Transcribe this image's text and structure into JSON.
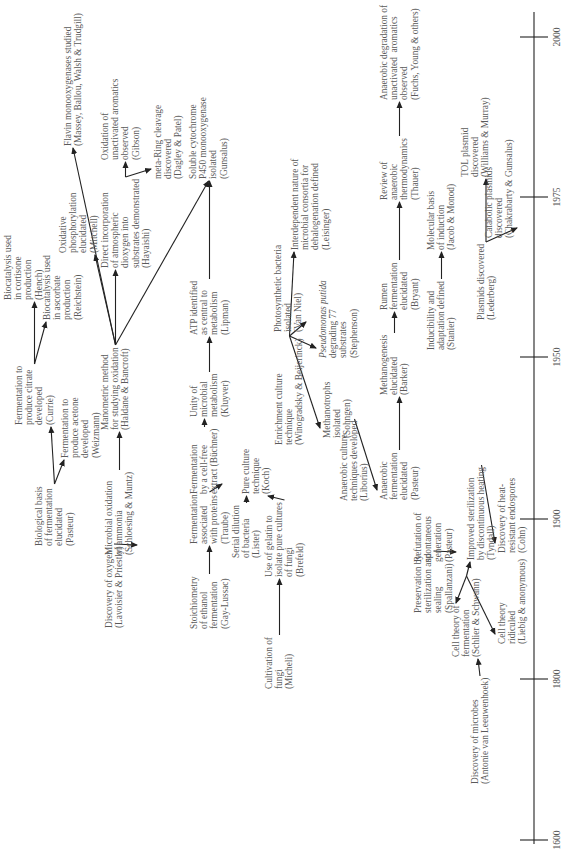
{
  "axis": {
    "ticks": [
      {
        "label": "1600",
        "u": 10
      },
      {
        "label": "1800",
        "u": 171
      },
      {
        "label": "1900",
        "u": 331
      },
      {
        "label": "1950",
        "u": 493
      },
      {
        "label": "1975",
        "u": 653
      },
      {
        "label": "2000",
        "u": 813
      }
    ]
  },
  "nodes": [
    {
      "id": "oxygen",
      "u": 222,
      "v": 104,
      "lines": [
        "Discovery of oxygen",
        "(Lavoisier & Priestly)"
      ]
    },
    {
      "id": "ammonia",
      "u": 295,
      "v": 104,
      "lines": [
        "Microbial oxidation",
        "of ammonia",
        "(Schloesing & Muntz)"
      ]
    },
    {
      "id": "biofer",
      "u": 304,
      "v": 34,
      "lines": [
        "Biological basis",
        "of fermentation",
        "elucidated",
        "(Pasteur)"
      ]
    },
    {
      "id": "citrate",
      "u": 425,
      "v": 14,
      "lines": [
        "Fermentation to",
        "produce citrate",
        "developed",
        "(Currie)"
      ]
    },
    {
      "id": "acetone",
      "u": 392,
      "v": 60,
      "lines": [
        "Fermentation to",
        "produce acetone",
        "developed",
        "(Weizmann)"
      ]
    },
    {
      "id": "cortisone",
      "u": 550,
      "v": 3,
      "lines": [
        "Biocatalysis used",
        "in cortisone",
        "production",
        "(Hench)"
      ]
    },
    {
      "id": "ascorbate",
      "u": 530,
      "v": 42,
      "lines": [
        "Biocatalysis used",
        "in ascorbate",
        "production",
        "(Reichstein)"
      ]
    },
    {
      "id": "manometric",
      "u": 420,
      "v": 100,
      "lines": [
        "Manometric method",
        "for studying oxidation",
        "(Haldane & Bancroft)"
      ]
    },
    {
      "id": "oxphos",
      "u": 597,
      "v": 58,
      "lines": [
        "Oxidative",
        "phosphorylation",
        "elucidated",
        "(Mitchell)"
      ]
    },
    {
      "id": "dioxygen",
      "u": 582,
      "v": 100,
      "lines": [
        "Direct incorporation",
        "of atmospheric",
        "dioxygen into",
        "substrates demonstrated",
        "(Hayaishi)"
      ]
    },
    {
      "id": "flavin",
      "u": 704,
      "v": 63,
      "lines": [
        "Flavin monooxygenases studied",
        "(Massey, Ballou, Walsh & Trudgill)"
      ]
    },
    {
      "id": "unactivated",
      "u": 690,
      "v": 100,
      "lines": [
        "Oxidation of",
        "unactivated aromatics",
        "observed",
        "(Gibson)"
      ]
    },
    {
      "id": "metaring",
      "u": 671,
      "v": 153,
      "lines": [
        "meta-Ring cleavage",
        "discovered",
        "(Dagley & Patel)"
      ]
    },
    {
      "id": "p450",
      "u": 671,
      "v": 188,
      "lines": [
        "Soluble cytochrome",
        "P450 monooxygenase",
        "isolated",
        "(Gunsalus)"
      ]
    },
    {
      "id": "stoich",
      "u": 221,
      "v": 189,
      "lines": [
        "Stoichiometry",
        "of ethanol",
        "fermentation",
        "(Gay-Lussac)"
      ]
    },
    {
      "id": "traube",
      "u": 306,
      "v": 189,
      "lines": [
        "Fermentation",
        "associated",
        "with proteins",
        "(Traube)"
      ]
    },
    {
      "id": "buchner",
      "u": 356,
      "v": 189,
      "lines": [
        "Fermentation",
        "by a cell-free",
        "extract (Büchner)"
      ]
    },
    {
      "id": "kluyver",
      "u": 433,
      "v": 189,
      "lines": [
        "Unity of",
        "microbial",
        "metabolism",
        "(Kluyver)"
      ]
    },
    {
      "id": "atp",
      "u": 515,
      "v": 189,
      "lines": [
        "ATP identified",
        "as central to",
        "metabolism",
        "(Lipman)"
      ]
    },
    {
      "id": "serial",
      "u": 292,
      "v": 231,
      "lines": [
        "Serial dilution",
        "of bacteria",
        "(Lister)"
      ]
    },
    {
      "id": "fungi",
      "u": 161,
      "v": 264,
      "lines": [
        "Cultivation of",
        "fungi",
        "(Micheli)"
      ]
    },
    {
      "id": "gelatin",
      "u": 273,
      "v": 264,
      "lines": [
        "Use of gelatin to",
        "isolate pure cultures",
        "of fungi",
        "(Brefeld)"
      ]
    },
    {
      "id": "pureculture",
      "u": 356,
      "v": 241,
      "lines": [
        "Pure culture",
        "technique",
        "(Koch)"
      ]
    },
    {
      "id": "enrichment",
      "u": 405,
      "v": 274,
      "lines": [
        "Enrichment culture",
        "technique",
        "(Winogradsky & Beijerinck)"
      ]
    },
    {
      "id": "methanotrophs",
      "u": 412,
      "v": 322,
      "lines": [
        "Methanotrophs",
        "isolated",
        "(Sohngen)"
      ]
    },
    {
      "id": "photosyn",
      "u": 518,
      "v": 273,
      "lines": [
        "Photosynthetic bacteria",
        "isolated",
        "(Van Niel)"
      ]
    },
    {
      "id": "pseudomonas",
      "u": 492,
      "v": 318,
      "lines": [
        "Pseudomonas putida",
        "degrading 77",
        "substrates",
        "(Stephenson)"
      ],
      "italic_first": true
    },
    {
      "id": "interdep",
      "u": 600,
      "v": 290,
      "lines": [
        "Interdependent nature of",
        "microbial consortia for",
        "dehalogenation defined",
        "(Leisinger)"
      ]
    },
    {
      "id": "anaerobictech",
      "u": 349,
      "v": 339,
      "lines": [
        "Anaerobic culture",
        "techniques developed",
        "(Liborius)"
      ]
    },
    {
      "id": "anaerobicferm",
      "u": 350,
      "v": 379,
      "lines": [
        "Anaerobic",
        "fermentation",
        "elucidated",
        "(Pasteur)"
      ]
    },
    {
      "id": "methanogenesis",
      "u": 455,
      "v": 379,
      "lines": [
        "Methanogenesis",
        "elucidated",
        "(Barker)"
      ]
    },
    {
      "id": "rumen",
      "u": 540,
      "v": 379,
      "lines": [
        "Rumen",
        "fermentation",
        "elucidated",
        "(Bryant)"
      ]
    },
    {
      "id": "reviewanaerobic",
      "u": 650,
      "v": 379,
      "lines": [
        "Review of",
        "anaerobic",
        "thermodynamics",
        "(Thauer)"
      ]
    },
    {
      "id": "anaerobicdeg",
      "u": 750,
      "v": 379,
      "lines": [
        "Anaerobic degradation of",
        "unactivated  aromatics",
        "observed",
        "(Fuchs, Young & others)"
      ]
    },
    {
      "id": "microbes",
      "u": 66,
      "v": 470,
      "lines": [
        "Discovery of microbes",
        "(Antonie van Leeuwenhoek)"
      ]
    },
    {
      "id": "celltheory",
      "u": 193,
      "v": 451,
      "lines": [
        "Cell theory of",
        "fermentation",
        "(Schlier & Schwann)"
      ]
    },
    {
      "id": "preservation",
      "u": 237,
      "v": 413,
      "lines": [
        "Preservation by",
        "sterilization and",
        "sealing",
        "(Spallanzani)"
      ]
    },
    {
      "id": "refutation",
      "u": 288,
      "v": 413,
      "lines": [
        "Refutation of",
        "spontaneous",
        "generation",
        "(Pasteur)"
      ]
    },
    {
      "id": "ridiculed",
      "u": 206,
      "v": 497,
      "lines": [
        "Cell theory",
        "ridiculed",
        "(Liebig & anonymous)"
      ]
    },
    {
      "id": "tyndall",
      "u": 290,
      "v": 466,
      "lines": [
        "Improved sterilization",
        "by discontinuous heating",
        "(Tyndall)"
      ]
    },
    {
      "id": "endospores",
      "u": 297,
      "v": 497,
      "lines": [
        "Discovery of heat-",
        "resistant endospores",
        "(Cohn)"
      ]
    },
    {
      "id": "inducibility",
      "u": 500,
      "v": 426,
      "lines": [
        "Inducibility and",
        "adaptation defined",
        "(Stanier)"
      ]
    },
    {
      "id": "molecularbasis",
      "u": 600,
      "v": 426,
      "lines": [
        "Molecular basis",
        "of induction",
        "(Jacob & Monod)"
      ]
    },
    {
      "id": "plasmids",
      "u": 530,
      "v": 476,
      "lines": [
        "Plasmids discovered",
        "(Lederberg)"
      ]
    },
    {
      "id": "tol",
      "u": 673,
      "v": 460,
      "lines": [
        "TOL plasmid",
        "discovered",
        "(Williams & Murray)"
      ]
    },
    {
      "id": "catabolic",
      "u": 612,
      "v": 484,
      "lines": [
        "Catabolic plasmids",
        "discovered",
        "(Chakrabarty & Gunsalus)"
      ]
    }
  ],
  "links": [
    [
      "oxygen",
      "ammonia"
    ],
    [
      "ammonia",
      "manometric"
    ],
    [
      "biofer",
      "citrate"
    ],
    [
      "biofer",
      "acetone"
    ],
    [
      "citrate",
      "cortisone"
    ],
    [
      "citrate",
      "ascorbate"
    ],
    [
      "manometric",
      "oxphos"
    ],
    [
      "manometric",
      "dioxygen"
    ],
    [
      "manometric",
      "flavin"
    ],
    [
      "manometric",
      "p450"
    ],
    [
      "dioxygen",
      "unactivated"
    ],
    [
      "dioxygen",
      "metaring"
    ],
    [
      "stoich",
      "traube"
    ],
    [
      "traube",
      "buchner"
    ],
    [
      "buchner",
      "kluyver"
    ],
    [
      "kluyver",
      "atp"
    ],
    [
      "atp",
      "p450"
    ],
    [
      "fungi",
      "gelatin"
    ],
    [
      "gelatin",
      "pureculture"
    ],
    [
      "serial",
      "pureculture"
    ],
    [
      "enrichment",
      "photosyn"
    ],
    [
      "enrichment",
      "pseudomonas"
    ],
    [
      "enrichment",
      "methanotrophs"
    ],
    [
      "enrichment",
      "interdep"
    ],
    [
      "anaerobictech",
      "anaerobicferm"
    ],
    [
      "anaerobicferm",
      "methanogenesis"
    ],
    [
      "methanogenesis",
      "rumen"
    ],
    [
      "rumen",
      "reviewanaerobic"
    ],
    [
      "reviewanaerobic",
      "anaerobicdeg"
    ],
    [
      "microbes",
      "celltheory"
    ],
    [
      "celltheory",
      "preservation"
    ],
    [
      "celltheory",
      "tyndall"
    ],
    [
      "celltheory",
      "ridiculed"
    ],
    [
      "preservation",
      "refutation"
    ],
    [
      "tyndall",
      "endospores"
    ],
    [
      "inducibility",
      "molecularbasis"
    ],
    [
      "plasmids",
      "tol"
    ],
    [
      "plasmids",
      "catabolic"
    ]
  ]
}
